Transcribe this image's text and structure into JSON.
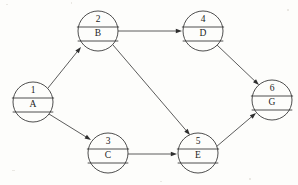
{
  "diagram": {
    "background_color": "#fdfdfb",
    "line_color": "#3a3a3a",
    "arrow_color": "#2e2e2e",
    "node_radius": 20,
    "nodes": [
      {
        "id": "1",
        "label": "A",
        "cx": 33,
        "cy": 102
      },
      {
        "id": "2",
        "label": "B",
        "cx": 98,
        "cy": 31
      },
      {
        "id": "3",
        "label": "C",
        "cx": 108,
        "cy": 153
      },
      {
        "id": "4",
        "label": "D",
        "cx": 203,
        "cy": 31
      },
      {
        "id": "5",
        "label": "E",
        "cx": 198,
        "cy": 153
      },
      {
        "id": "6",
        "label": "G",
        "cx": 272,
        "cy": 100
      }
    ],
    "edges": [
      {
        "from": "1",
        "to": "2",
        "x1": 48,
        "y1": 88,
        "x2": 81,
        "y2": 47
      },
      {
        "from": "1",
        "to": "3",
        "x1": 49,
        "y1": 114,
        "x2": 91,
        "y2": 140
      },
      {
        "from": "2",
        "to": "4",
        "x1": 118,
        "y1": 31,
        "x2": 182,
        "y2": 31
      },
      {
        "from": "2",
        "to": "5",
        "x1": 113,
        "y1": 45,
        "x2": 190,
        "y2": 135
      },
      {
        "from": "4",
        "to": "6",
        "x1": 217,
        "y1": 45,
        "x2": 259,
        "y2": 85
      },
      {
        "from": "3",
        "to": "5",
        "x1": 128,
        "y1": 154,
        "x2": 177,
        "y2": 154
      },
      {
        "from": "5",
        "to": "6",
        "x1": 216,
        "y1": 147,
        "x2": 256,
        "y2": 113
      }
    ]
  }
}
